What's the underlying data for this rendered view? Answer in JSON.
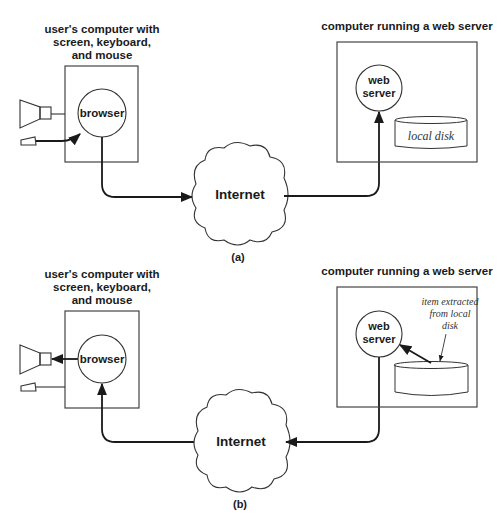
{
  "panels": [
    {
      "id": "a",
      "caption": "(a)",
      "client": {
        "title_lines": [
          "user's computer with",
          "screen, keyboard,",
          "and mouse"
        ],
        "process_label": "browser"
      },
      "network": {
        "label": "Internet"
      },
      "server": {
        "title": "computer running a web server",
        "process_label_lines": [
          "web",
          "server"
        ],
        "disk_label": "local disk"
      },
      "flow": "request: keyboard/mouse -> browser -> Internet -> web server"
    },
    {
      "id": "b",
      "caption": "(b)",
      "client": {
        "title_lines": [
          "user's computer with",
          "screen, keyboard,",
          "and mouse"
        ],
        "process_label": "browser"
      },
      "network": {
        "label": "Internet"
      },
      "server": {
        "title": "computer running a web server",
        "process_label_lines": [
          "web",
          "server"
        ],
        "disk_annotation_lines": [
          "item extracted",
          "from local",
          "disk"
        ]
      },
      "flow": "response: disk -> web server -> Internet -> browser -> screen"
    }
  ],
  "colors": {
    "ink": "#1a1a1a",
    "line": "#444444",
    "background": "#ffffff"
  }
}
